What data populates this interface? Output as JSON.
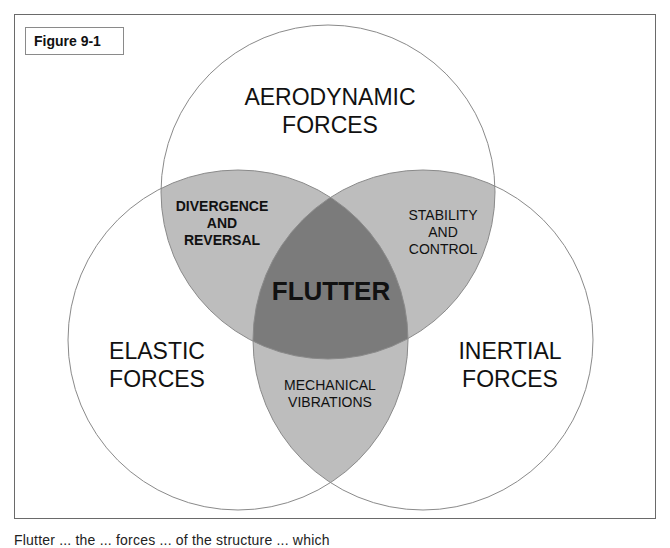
{
  "figure_label": "Figure 9-1",
  "colors": {
    "circle_stroke": "#8a8a8a",
    "pair_overlap_fill": "#bdbdbd",
    "triple_overlap_fill": "#7b7b7b",
    "background": "#ffffff"
  },
  "circles": {
    "top": {
      "line1": "AERODYNAMIC",
      "line2": "FORCES"
    },
    "left": {
      "line1": "ELASTIC",
      "line2": "FORCES"
    },
    "right": {
      "line1": "INERTIAL",
      "line2": "FORCES"
    }
  },
  "overlaps": {
    "top_left": {
      "line1": "DIVERGENCE",
      "line2": "AND",
      "line3": "REVERSAL"
    },
    "top_right": {
      "line1": "STABILITY",
      "line2": "AND",
      "line3": "CONTROL"
    },
    "left_right": {
      "line1": "MECHANICAL",
      "line2": "VIBRATIONS"
    },
    "center": "FLUTTER"
  },
  "caption": "Flutter ... the ... forces ... of the structure ... which"
}
